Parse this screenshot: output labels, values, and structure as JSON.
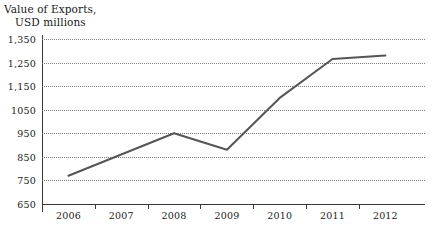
{
  "chart_data": {
    "type": "line",
    "title_lines": [
      "Value of Exports,",
      "USD millions"
    ],
    "xlabel": "",
    "ylabel": "",
    "categories": [
      "2006",
      "2007",
      "2008",
      "2009",
      "2010",
      "2011",
      "2012"
    ],
    "series": [
      {
        "name": "Value of Exports",
        "color": "#555555",
        "values": [
          770,
          860,
          950,
          880,
          1100,
          1265,
          1280
        ]
      }
    ],
    "ylim": [
      650,
      1350
    ],
    "ytick_values": [
      650,
      750,
      850,
      950,
      1050,
      1150,
      1250,
      1350
    ],
    "ytick_labels": [
      "650",
      "750",
      "850",
      "950",
      "1050",
      "1,150",
      "1,250",
      "1,350"
    ],
    "grid": "horizontal-dotted",
    "legend": "none"
  },
  "axes": {
    "y_axis_color": "#3a3a3a",
    "x_axis_color": "#3a3a3a",
    "gridline_color": "#7a7a7a"
  }
}
